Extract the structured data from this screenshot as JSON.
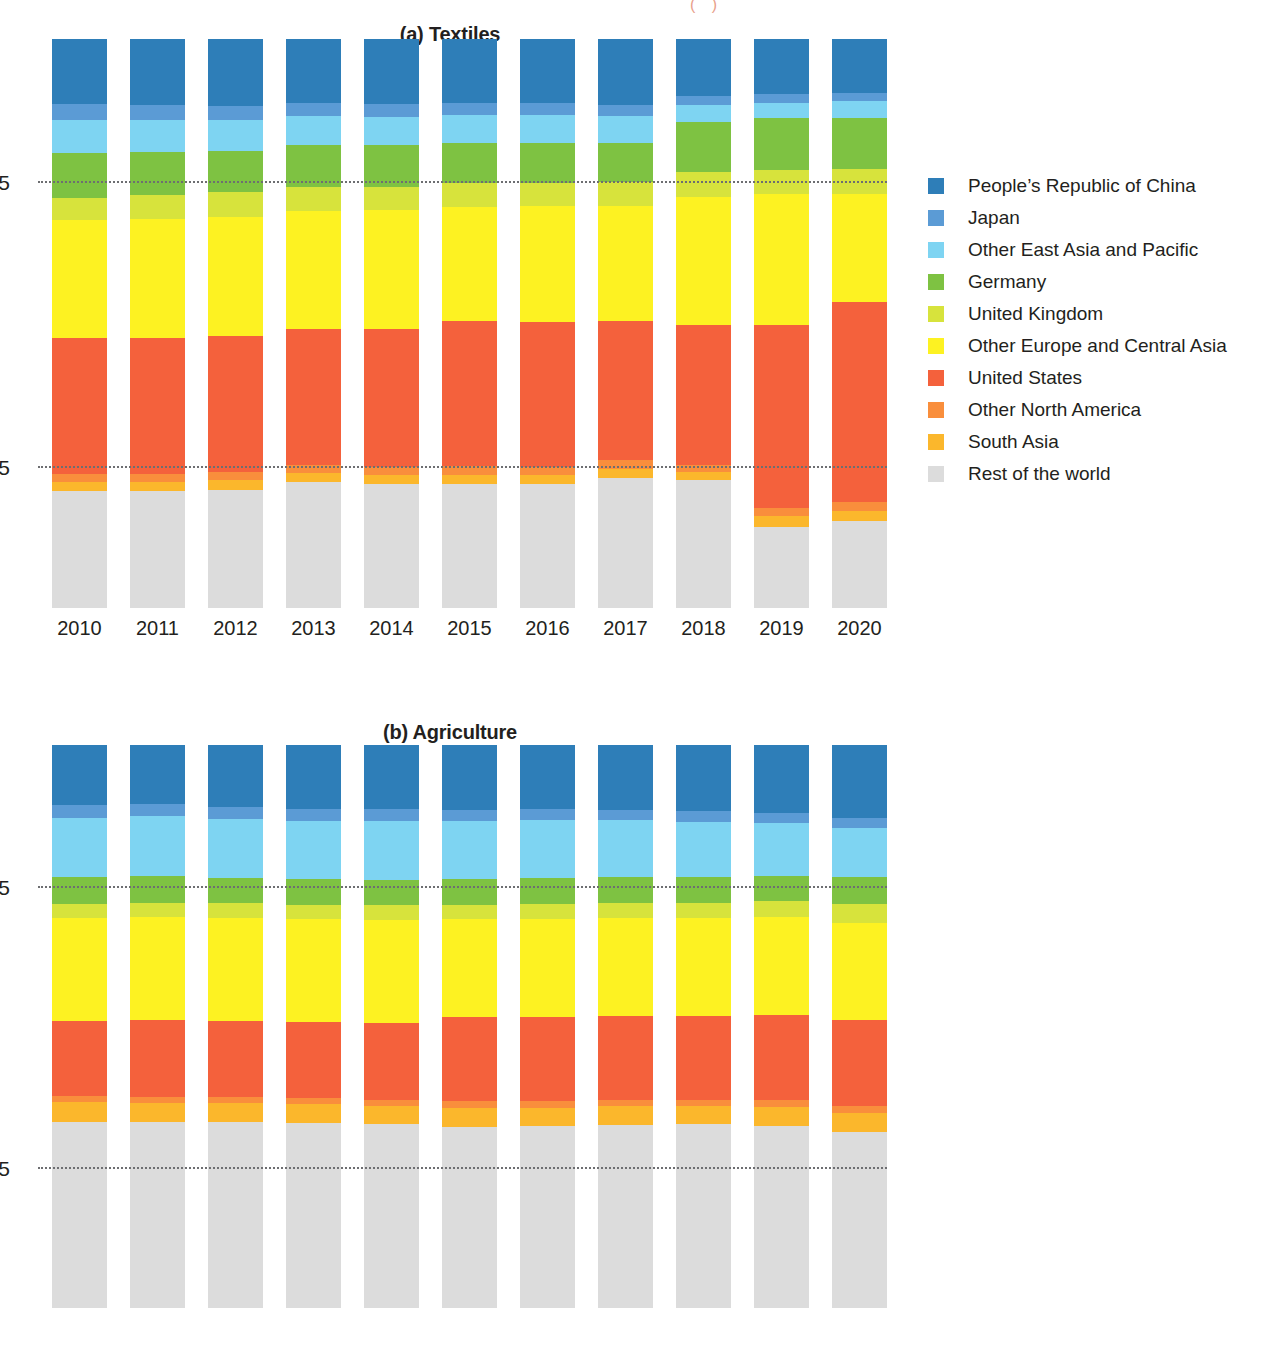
{
  "figure": {
    "top_fragment": "( )"
  },
  "panels": [
    {
      "id": "textiles",
      "title": "(a) Textiles",
      "yticks": [
        "75",
        "25"
      ],
      "ytick_values": [
        75,
        25
      ]
    },
    {
      "id": "agriculture",
      "title": "(b) Agriculture",
      "yticks": [
        "75",
        "25"
      ],
      "ytick_values": [
        75,
        25
      ]
    }
  ],
  "legend": {
    "entries": [
      {
        "label": "People’s Republic of China",
        "color": "#2e7eb8"
      },
      {
        "label": "Japan",
        "color": "#5b9bd5"
      },
      {
        "label": "Other East Asia and Pacific",
        "color": "#7ed4f2"
      },
      {
        "label": "Germany",
        "color": "#7ec242"
      },
      {
        "label": "United Kingdom",
        "color": "#d7e33c"
      },
      {
        "label": "Other Europe and Central Asia",
        "color": "#fdf222"
      },
      {
        "label": "United States",
        "color": "#f4613c"
      },
      {
        "label": "Other North America",
        "color": "#f98e3c"
      },
      {
        "label": "South Asia",
        "color": "#fbb72c"
      },
      {
        "label": "Rest of the world",
        "color": "#dcdcdc"
      }
    ]
  },
  "chart_data": [
    {
      "type": "bar",
      "subtype": "stacked-100-percent",
      "title": "(a) Textiles",
      "xlabel": "",
      "ylabel": "",
      "ylim": [
        0,
        100
      ],
      "yticks": [
        25,
        75
      ],
      "grid": "horizontal-dotted",
      "legend_position": "right",
      "categories": [
        "2010",
        "2011",
        "2012",
        "2013",
        "2014",
        "2015",
        "2016",
        "2017",
        "2018",
        "2019",
        "2020"
      ],
      "series": [
        {
          "name": "People’s Republic of China",
          "color": "#2e7eb8",
          "values": [
            11.4,
            11.6,
            11.8,
            11.3,
            11.4,
            11.2,
            11.3,
            11.6,
            10.0,
            9.7,
            9.5
          ]
        },
        {
          "name": "Japan",
          "color": "#5b9bd5",
          "values": [
            2.8,
            2.6,
            2.5,
            2.3,
            2.3,
            2.1,
            2.1,
            2.0,
            1.6,
            1.6,
            1.4
          ]
        },
        {
          "name": "Other East Asia and Pacific",
          "color": "#7ed4f2",
          "values": [
            5.8,
            5.6,
            5.4,
            5.1,
            5.0,
            4.9,
            4.8,
            4.6,
            3.0,
            2.6,
            3.0
          ]
        },
        {
          "name": "Germany",
          "color": "#7ec242",
          "values": [
            7.9,
            7.6,
            7.2,
            7.3,
            7.3,
            7.1,
            7.2,
            7.0,
            8.7,
            9.1,
            9.0
          ]
        },
        {
          "name": "United Kingdom",
          "color": "#d7e33c",
          "values": [
            4.0,
            4.3,
            4.4,
            4.3,
            4.1,
            4.2,
            4.0,
            4.1,
            4.5,
            4.3,
            4.3
          ]
        },
        {
          "name": "Other Europe and Central Asia",
          "color": "#fdf222",
          "values": [
            20.7,
            20.8,
            20.9,
            20.6,
            20.8,
            20.0,
            20.4,
            20.3,
            22.5,
            23.0,
            19.0
          ]
        },
        {
          "name": "United States",
          "color": "#f4613c",
          "values": [
            23.8,
            24.0,
            23.9,
            24.0,
            24.3,
            25.6,
            25.4,
            24.4,
            24.5,
            32.2,
            35.2
          ]
        },
        {
          "name": "Other North America",
          "color": "#f98e3c",
          "values": [
            1.4,
            1.4,
            1.5,
            1.4,
            1.5,
            1.5,
            1.5,
            1.5,
            1.3,
            1.4,
            1.6
          ]
        },
        {
          "name": "South Asia",
          "color": "#fbb72c",
          "values": [
            1.6,
            1.6,
            1.7,
            1.6,
            1.6,
            1.7,
            1.6,
            1.7,
            1.5,
            1.8,
            1.8
          ]
        },
        {
          "name": "Rest of the world",
          "color": "#dcdcdc",
          "values": [
            20.6,
            20.5,
            20.7,
            22.1,
            21.7,
            21.7,
            21.7,
            22.8,
            22.4,
            14.3,
            15.2
          ]
        }
      ]
    },
    {
      "type": "bar",
      "subtype": "stacked-100-percent",
      "title": "(b) Agriculture",
      "xlabel": "",
      "ylabel": "",
      "ylim": [
        0,
        100
      ],
      "yticks": [
        25,
        75
      ],
      "grid": "horizontal-dotted",
      "legend_position": "right",
      "categories": [
        "2010",
        "2011",
        "2012",
        "2013",
        "2014",
        "2015",
        "2016",
        "2017",
        "2018",
        "2019",
        "2020"
      ],
      "series": [
        {
          "name": "People’s Republic of China",
          "color": "#2e7eb8",
          "values": [
            10.6,
            10.5,
            11.0,
            11.4,
            11.4,
            11.5,
            11.4,
            11.5,
            11.8,
            12.0,
            13.0
          ]
        },
        {
          "name": "Japan",
          "color": "#5b9bd5",
          "values": [
            2.3,
            2.2,
            2.1,
            2.1,
            2.1,
            2.0,
            2.0,
            1.9,
            1.8,
            1.8,
            1.7
          ]
        },
        {
          "name": "Other East Asia and Pacific",
          "color": "#7ed4f2",
          "values": [
            10.5,
            10.6,
            10.5,
            10.3,
            10.4,
            10.3,
            10.2,
            10.1,
            9.8,
            9.5,
            8.8
          ]
        },
        {
          "name": "Germany",
          "color": "#7ec242",
          "values": [
            4.8,
            4.7,
            4.5,
            4.6,
            4.5,
            4.6,
            4.7,
            4.6,
            4.6,
            4.5,
            4.7
          ]
        },
        {
          "name": "United Kingdom",
          "color": "#d7e33c",
          "values": [
            2.6,
            2.6,
            2.6,
            2.6,
            2.7,
            2.6,
            2.6,
            2.6,
            2.7,
            2.7,
            3.5
          ]
        },
        {
          "name": "Other Europe and Central Asia",
          "color": "#fdf222",
          "values": [
            18.2,
            18.2,
            18.3,
            18.2,
            18.3,
            17.3,
            17.4,
            17.4,
            17.4,
            17.4,
            17.1
          ]
        },
        {
          "name": "United States",
          "color": "#f4613c",
          "values": [
            13.4,
            13.7,
            13.5,
            13.5,
            13.6,
            15.0,
            15.0,
            15.0,
            15.0,
            15.2,
            15.4
          ]
        },
        {
          "name": "Other North America",
          "color": "#f98e3c",
          "values": [
            1.1,
            1.1,
            1.1,
            1.1,
            1.1,
            1.1,
            1.1,
            1.1,
            1.1,
            1.2,
            1.2
          ]
        },
        {
          "name": "South Asia",
          "color": "#fbb72c",
          "values": [
            3.5,
            3.4,
            3.4,
            3.3,
            3.3,
            3.4,
            3.3,
            3.3,
            3.2,
            3.4,
            3.3
          ]
        },
        {
          "name": "Rest of the world",
          "color": "#dcdcdc",
          "values": [
            33.0,
            33.0,
            33.0,
            32.9,
            32.6,
            32.2,
            32.3,
            32.5,
            32.6,
            32.3,
            31.3
          ]
        }
      ]
    }
  ]
}
